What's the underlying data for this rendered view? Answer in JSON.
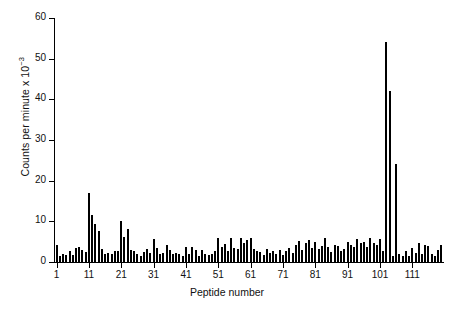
{
  "chart_data": {
    "type": "bar",
    "title": "",
    "subtitle": "",
    "xlabel": "Peptide number",
    "ylabel": "Counts per minute x 10",
    "ylabel_exponent": "−3",
    "ylim": [
      0,
      60
    ],
    "xlim": [
      0.2,
      120.8
    ],
    "ytick_labels": [
      "0",
      "10",
      "20",
      "30",
      "40",
      "50",
      "60"
    ],
    "yticks": [
      0,
      10,
      20,
      30,
      40,
      50,
      60
    ],
    "xtick_labels": [
      "1",
      "11",
      "21",
      "31",
      "41",
      "51",
      "61",
      "71",
      "81",
      "91",
      "101",
      "111"
    ],
    "xticks": [
      1,
      11,
      21,
      31,
      41,
      51,
      61,
      71,
      81,
      91,
      101,
      111
    ],
    "grid": false,
    "legend": null,
    "bar_color": "#000000",
    "categories": [
      1,
      2,
      3,
      4,
      5,
      6,
      7,
      8,
      9,
      10,
      11,
      12,
      13,
      14,
      15,
      16,
      17,
      18,
      19,
      20,
      21,
      22,
      23,
      24,
      25,
      26,
      27,
      28,
      29,
      30,
      31,
      32,
      33,
      34,
      35,
      36,
      37,
      38,
      39,
      40,
      41,
      42,
      43,
      44,
      45,
      46,
      47,
      48,
      49,
      50,
      51,
      52,
      53,
      54,
      55,
      56,
      57,
      58,
      59,
      60,
      61,
      62,
      63,
      64,
      65,
      66,
      67,
      68,
      69,
      70,
      71,
      72,
      73,
      74,
      75,
      76,
      77,
      78,
      79,
      80,
      81,
      82,
      83,
      84,
      85,
      86,
      87,
      88,
      89,
      90,
      91,
      92,
      93,
      94,
      95,
      96,
      97,
      98,
      99,
      100,
      101,
      102,
      103,
      104,
      105,
      106,
      107,
      108,
      109,
      110,
      111,
      112,
      113,
      114,
      115,
      116,
      117,
      118,
      119,
      120
    ],
    "values": [
      4.3,
      1.6,
      2.0,
      1.8,
      2.6,
      1.7,
      3.4,
      3.6,
      3.0,
      2.4,
      17.0,
      11.6,
      9.3,
      7.6,
      3.1,
      2.0,
      2.3,
      2.0,
      2.6,
      2.8,
      10.0,
      6.1,
      8.2,
      3.0,
      2.6,
      2.0,
      1.4,
      2.4,
      3.1,
      2.2,
      5.6,
      3.4,
      2.0,
      2.3,
      4.3,
      3.0,
      2.0,
      2.3,
      2.0,
      1.5,
      3.6,
      2.0,
      3.8,
      3.0,
      1.6,
      3.0,
      2.0,
      1.8,
      2.0,
      2.6,
      6.0,
      3.8,
      4.5,
      2.8,
      5.8,
      3.4,
      3.2,
      6.0,
      4.6,
      5.4,
      6.0,
      3.2,
      2.6,
      2.4,
      1.8,
      3.1,
      2.2,
      2.6,
      2.0,
      3.0,
      1.7,
      2.6,
      3.4,
      2.3,
      4.3,
      5.1,
      3.0,
      4.6,
      5.4,
      3.4,
      5.0,
      3.2,
      4.0,
      6.0,
      3.6,
      2.4,
      4.3,
      4.0,
      2.6,
      3.2,
      5.0,
      4.3,
      3.6,
      5.6,
      4.6,
      5.0,
      3.6,
      6.0,
      4.6,
      4.3,
      5.6,
      2.6,
      54.0,
      42.0,
      1.6,
      24.0,
      2.0,
      1.4,
      2.8,
      1.6,
      3.4,
      2.2,
      4.6,
      2.0,
      4.3,
      4.0,
      2.0,
      1.6,
      3.0,
      4.3
    ]
  }
}
